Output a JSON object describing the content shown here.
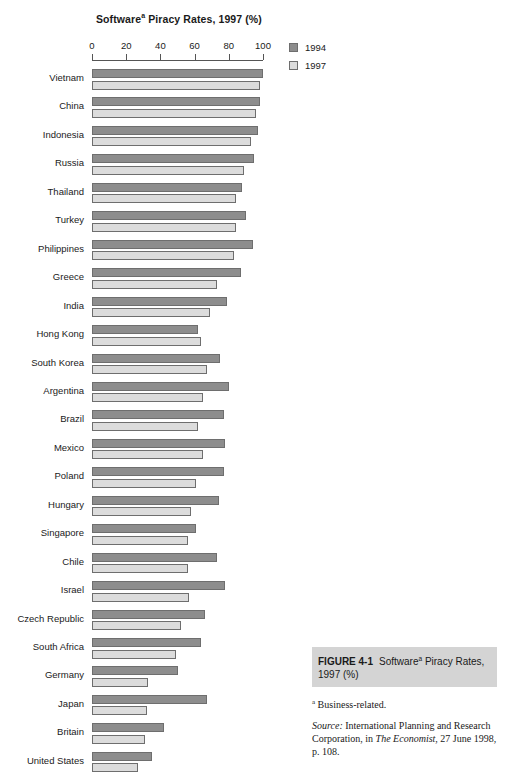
{
  "chart_data": {
    "type": "bar",
    "orientation": "horizontal",
    "title_main": "Software",
    "title_sup": "a",
    "title_rest": " Piracy Rates, 1997 (%)",
    "xlabel": "",
    "ylabel": "",
    "xlim": [
      0,
      100
    ],
    "xticks": [
      0,
      20,
      40,
      60,
      80,
      100
    ],
    "xtick_labels": [
      "0",
      "20",
      "40",
      "60",
      "80",
      "100"
    ],
    "grid": false,
    "legend_position": "top-right",
    "categories": [
      "Vietnam",
      "China",
      "Indonesia",
      "Russia",
      "Thailand",
      "Turkey",
      "Philippines",
      "Greece",
      "India",
      "Hong Kong",
      "South Korea",
      "Argentina",
      "Brazil",
      "Mexico",
      "Poland",
      "Hungary",
      "Singapore",
      "Chile",
      "Israel",
      "Czech Republic",
      "South Africa",
      "Germany",
      "Japan",
      "Britain",
      "United States"
    ],
    "series": [
      {
        "name": "1994",
        "color": "#8d8d8d",
        "values": [
          100,
          98,
          97,
          95,
          88,
          90,
          94,
          87,
          79,
          62,
          75,
          80,
          77,
          78,
          77,
          74,
          61,
          73,
          78,
          66,
          64,
          50,
          67,
          42,
          35
        ]
      },
      {
        "name": "1997",
        "color": "#dcdcdc",
        "values": [
          98,
          96,
          93,
          89,
          84,
          84,
          83,
          73,
          69,
          64,
          67,
          65,
          62,
          65,
          61,
          58,
          56,
          56,
          57,
          52,
          49,
          33,
          32,
          31,
          27
        ]
      }
    ]
  },
  "legend": {
    "items": [
      {
        "label": "1994",
        "swatch": "s1994"
      },
      {
        "label": "1997",
        "swatch": "s1997"
      }
    ]
  },
  "caption": {
    "figure_number": "FIGURE 4-1",
    "figure_title_main": "Software",
    "figure_title_sup": "a",
    "figure_title_rest": " Piracy Rates, 1997 (%)",
    "note_sup": "a",
    "note_text": " Business-related.",
    "source_label": "Source:",
    "source_text_1": " International Planning and Research Corporation, in ",
    "source_italic_1": "The Economist",
    "source_text_2": ", 27 June 1998, p. 108."
  },
  "colors": {
    "bar_1994": "#8d8d8d",
    "bar_1997": "#dcdcdc",
    "bar_border": "#6e6e6e",
    "axis": "#555555",
    "caption_bg": "#d4d4d4",
    "background": "#ffffff",
    "text": "#1a1a1a"
  }
}
